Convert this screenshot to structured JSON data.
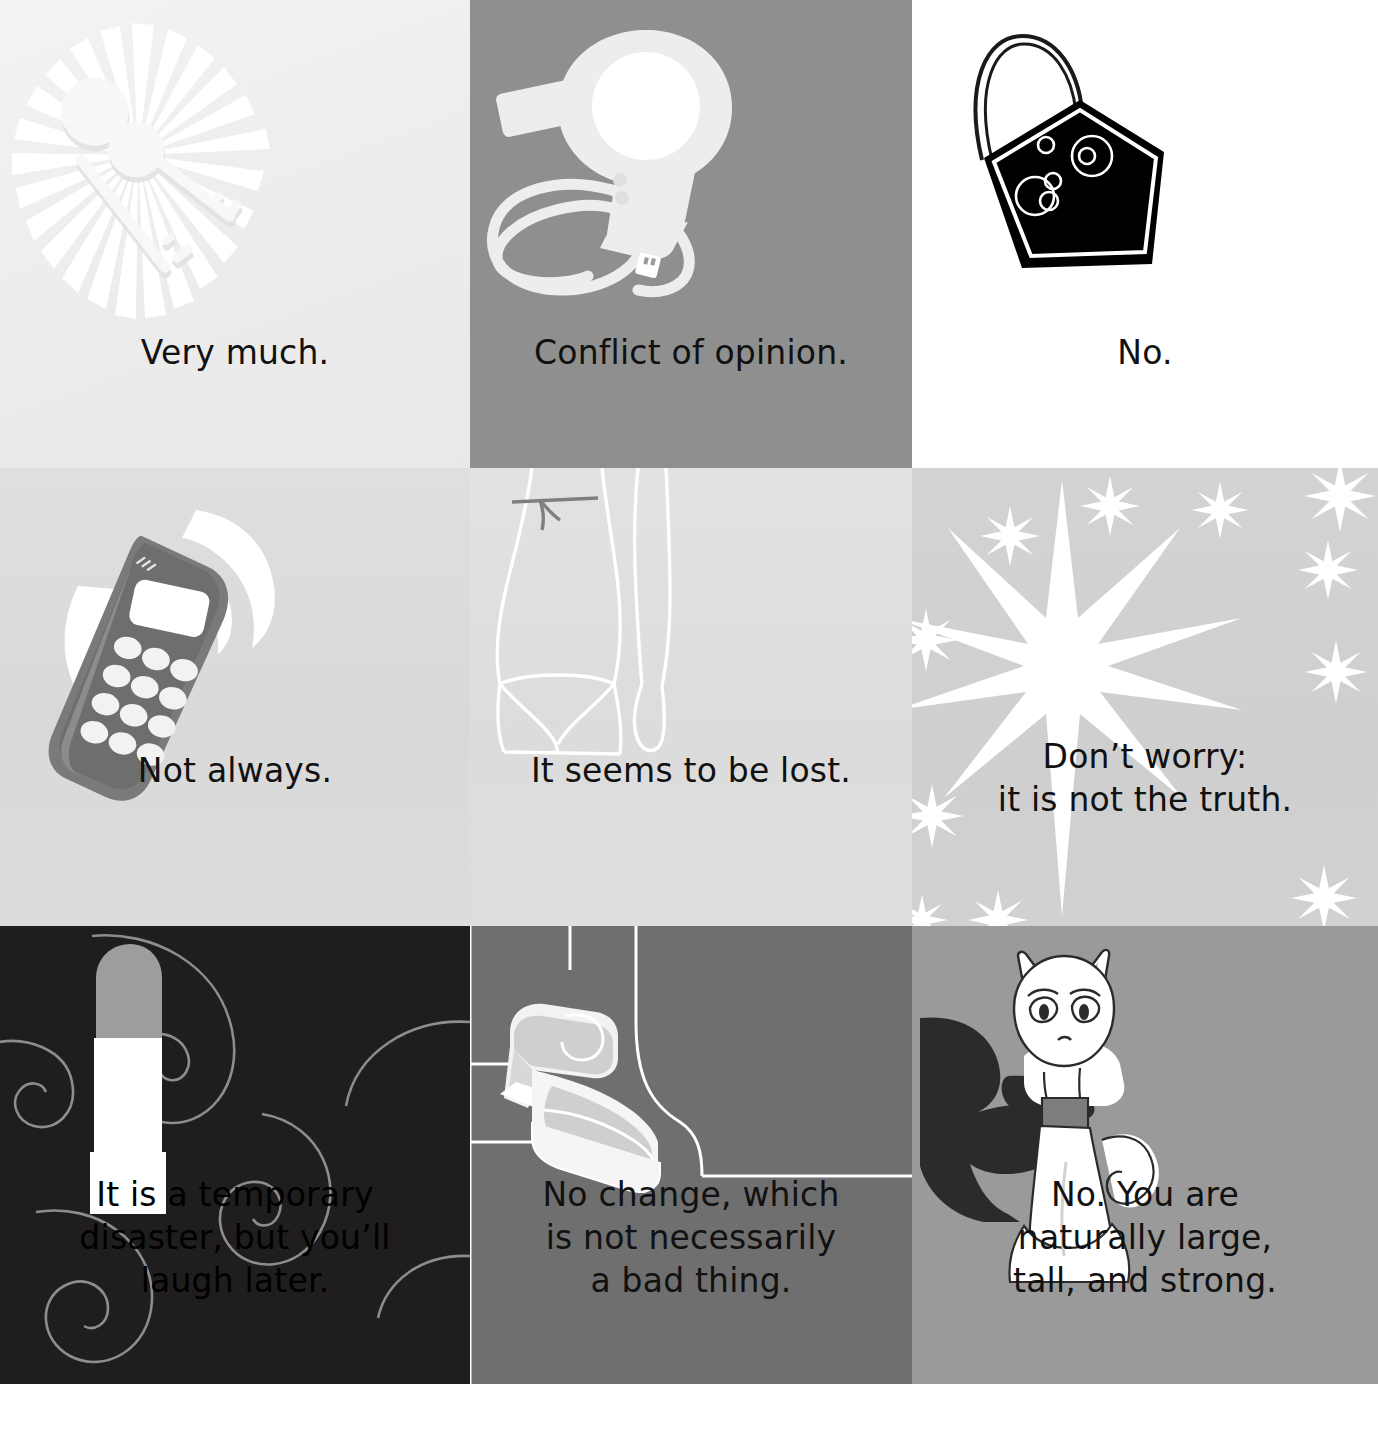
{
  "page": {
    "kind": "greeting-card-grid",
    "rows": 3,
    "columns": 3,
    "background": "#ffffff"
  },
  "panels": [
    {
      "id": "keys",
      "position": "row1-col1",
      "caption": "Very much.",
      "icon": "keys-icon",
      "icon_description": "two keys on a ring with sunburst rays",
      "background_color": "#ececec",
      "text_color": "#111111",
      "art_color": "#ffffff"
    },
    {
      "id": "hair-dryer",
      "position": "row1-col2",
      "caption": "Conflict of opinion.",
      "icon": "hair-dryer-icon",
      "icon_description": "hair dryer with coiled cord and plug",
      "background_color": "#8f8f8f",
      "text_color": "#111111",
      "art_color": "#ededed"
    },
    {
      "id": "handbag",
      "position": "row1-col3",
      "caption": "No.",
      "icon": "handbag-icon",
      "icon_description": "black handbag with thin handle and bubble circles",
      "background_color": "#ffffff",
      "text_color": "#111111",
      "art_color": "#000000"
    },
    {
      "id": "mobile-phone",
      "position": "row2-col1",
      "caption": "Not always.",
      "icon": "mobile-phone-icon",
      "icon_description": "ringing mobile phone with vibration arcs",
      "background_color": "#dadada",
      "text_color": "#111111",
      "art_color": "#7c7c7c"
    },
    {
      "id": "bikini-figure",
      "position": "row2-col2",
      "caption": "It seems to be lost.",
      "icon": "bikini-figure-icon",
      "icon_description": "white outline of a woman's hips wearing bikini bottoms",
      "background_color": "#dedede",
      "text_color": "#111111",
      "art_color": "#ffffff"
    },
    {
      "id": "stars",
      "position": "row2-col3",
      "caption": "Don’t worry:\nit is not the truth.",
      "icon": "sparkle-star-icon",
      "icon_description": "large eight-pointed star with smaller sparkles",
      "background_color": "#d0d0d0",
      "text_color": "#111111",
      "art_color": "#ffffff"
    },
    {
      "id": "lipstick",
      "position": "row3-col1",
      "caption": "It is a temporary\ndisaster, but you’ll\nlaugh later.",
      "icon": "lipstick-icon",
      "icon_description": "open lipstick tube over swirling spirals",
      "background_color": "#1f1d1d",
      "text_color": "#000000",
      "art_color": "#ffffff"
    },
    {
      "id": "platform-shoes",
      "position": "row3-col2",
      "caption": "No change, which\nis not necessarily\na bad thing.",
      "icon": "platform-shoes-icon",
      "icon_description": "pair of outlined platform sandals in a corner",
      "background_color": "#6f6f6f",
      "text_color": "#111111",
      "art_color": "#ffffff"
    },
    {
      "id": "cat",
      "position": "row3-col3",
      "caption": "No. You are\nnaturally large,\ntall, and strong.",
      "icon": "cat-icon",
      "icon_description": "white sitting cat with dark collar and cast shadow",
      "background_color": "#9a9a9a",
      "text_color": "#111111",
      "art_color": "#ffffff"
    }
  ]
}
